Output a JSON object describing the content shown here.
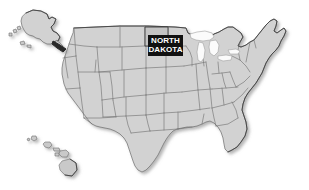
{
  "figure": {
    "type": "map",
    "projection_note": "Alaska and Hawaii shown as insets at lower-left / upper-left",
    "background_color": "#ffffff",
    "land_fill_color": "#d2d2d2",
    "border_color": "#767676",
    "outline_color": "#4a4a4a"
  },
  "highlight": {
    "state_name": "NORTH DAKOTA",
    "label_line_1": "NORTH",
    "label_line_2": "DAKOTA",
    "label_background_color": "#111111",
    "label_text_color": "#ffffff",
    "state_fill_color": "#c4c4c4"
  },
  "insets": [
    {
      "name": "Alaska",
      "position": "upper-left"
    },
    {
      "name": "Hawaii",
      "position": "lower-left"
    }
  ],
  "features": [
    {
      "name": "contiguous-united-states"
    },
    {
      "name": "great-lakes"
    },
    {
      "name": "alaska"
    },
    {
      "name": "hawaii"
    }
  ]
}
